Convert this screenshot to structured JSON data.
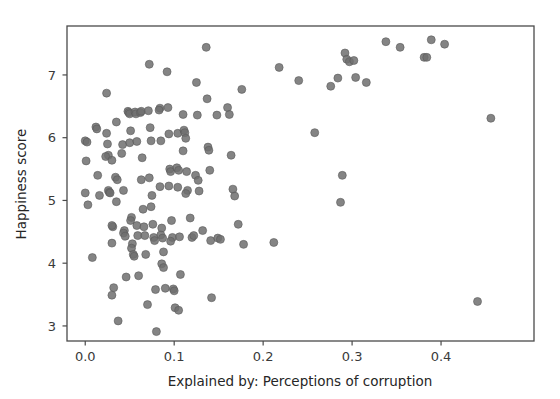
{
  "chart_data": {
    "type": "scatter",
    "title": "",
    "subtitle": "",
    "xlabel": "Explained by: Perceptions of corruption",
    "ylabel": "Happiness score",
    "xlim": [
      -0.0205,
      0.5045
    ],
    "ylim": [
      2.76,
      7.78
    ],
    "xticks": [
      0.0,
      0.1,
      0.2,
      0.3,
      0.4
    ],
    "xtick_labels": [
      "0.0",
      "0.1",
      "0.2",
      "0.3",
      "0.4"
    ],
    "yticks": [
      3,
      4,
      5,
      6,
      7
    ],
    "ytick_labels": [
      "3",
      "4",
      "5",
      "6",
      "7"
    ],
    "grid": false,
    "legend": false,
    "legend_position": "none",
    "marker": {
      "shape": "circle",
      "color": "#6e6e6e",
      "edge_color": "#5a5a5a",
      "size": 8,
      "alpha": 0.85
    },
    "spines": {
      "color": "#4a4a4a",
      "top": true,
      "right": true,
      "bottom": true,
      "left": true
    },
    "n_points": 155,
    "points": [
      [
        0.0,
        5.95
      ],
      [
        0.002,
        5.93
      ],
      [
        0.001,
        5.63
      ],
      [
        0.0,
        5.12
      ],
      [
        0.003,
        4.93
      ],
      [
        0.008,
        4.09
      ],
      [
        0.012,
        6.17
      ],
      [
        0.013,
        6.14
      ],
      [
        0.014,
        5.4
      ],
      [
        0.016,
        5.08
      ],
      [
        0.024,
        6.71
      ],
      [
        0.024,
        6.07
      ],
      [
        0.025,
        5.9
      ],
      [
        0.026,
        5.72
      ],
      [
        0.023,
        5.7
      ],
      [
        0.026,
        5.16
      ],
      [
        0.027,
        5.13
      ],
      [
        0.03,
        5.64
      ],
      [
        0.028,
        5.12
      ],
      [
        0.031,
        4.58
      ],
      [
        0.03,
        4.6
      ],
      [
        0.03,
        4.32
      ],
      [
        0.032,
        3.61
      ],
      [
        0.03,
        3.49
      ],
      [
        0.035,
        6.25
      ],
      [
        0.034,
        5.37
      ],
      [
        0.036,
        5.33
      ],
      [
        0.035,
        4.98
      ],
      [
        0.037,
        3.08
      ],
      [
        0.042,
        5.89
      ],
      [
        0.041,
        5.75
      ],
      [
        0.043,
        5.16
      ],
      [
        0.044,
        4.52
      ],
      [
        0.043,
        4.48
      ],
      [
        0.045,
        4.43
      ],
      [
        0.046,
        3.78
      ],
      [
        0.048,
        6.42
      ],
      [
        0.049,
        6.4
      ],
      [
        0.05,
        6.38
      ],
      [
        0.051,
        6.11
      ],
      [
        0.05,
        5.92
      ],
      [
        0.052,
        4.73
      ],
      [
        0.051,
        4.68
      ],
      [
        0.053,
        4.31
      ],
      [
        0.052,
        4.24
      ],
      [
        0.054,
        4.14
      ],
      [
        0.055,
        4.11
      ],
      [
        0.056,
        6.41
      ],
      [
        0.057,
        6.38
      ],
      [
        0.058,
        5.94
      ],
      [
        0.058,
        4.6
      ],
      [
        0.059,
        4.44
      ],
      [
        0.06,
        3.8
      ],
      [
        0.062,
        6.4
      ],
      [
        0.063,
        6.42
      ],
      [
        0.064,
        5.68
      ],
      [
        0.063,
        5.33
      ],
      [
        0.065,
        4.86
      ],
      [
        0.066,
        4.58
      ],
      [
        0.067,
        4.44
      ],
      [
        0.068,
        4.14
      ],
      [
        0.07,
        3.34
      ],
      [
        0.072,
        7.17
      ],
      [
        0.071,
        6.43
      ],
      [
        0.073,
        6.16
      ],
      [
        0.074,
        5.95
      ],
      [
        0.072,
        5.36
      ],
      [
        0.075,
        5.08
      ],
      [
        0.074,
        4.9
      ],
      [
        0.076,
        4.62
      ],
      [
        0.077,
        4.41
      ],
      [
        0.078,
        4.36
      ],
      [
        0.079,
        3.58
      ],
      [
        0.08,
        2.91
      ],
      [
        0.084,
        6.47
      ],
      [
        0.083,
        6.44
      ],
      [
        0.085,
        5.95
      ],
      [
        0.084,
        5.22
      ],
      [
        0.086,
        4.56
      ],
      [
        0.085,
        4.45
      ],
      [
        0.087,
        4.4
      ],
      [
        0.088,
        4.18
      ],
      [
        0.086,
        3.99
      ],
      [
        0.088,
        3.93
      ],
      [
        0.09,
        3.6
      ],
      [
        0.092,
        7.05
      ],
      [
        0.093,
        6.48
      ],
      [
        0.094,
        6.06
      ],
      [
        0.095,
        5.5
      ],
      [
        0.096,
        5.46
      ],
      [
        0.094,
        5.23
      ],
      [
        0.097,
        4.68
      ],
      [
        0.098,
        4.41
      ],
      [
        0.096,
        4.35
      ],
      [
        0.099,
        3.59
      ],
      [
        0.1,
        3.56
      ],
      [
        0.101,
        3.29
      ],
      [
        0.104,
        6.07
      ],
      [
        0.103,
        5.52
      ],
      [
        0.105,
        5.48
      ],
      [
        0.104,
        5.21
      ],
      [
        0.106,
        4.42
      ],
      [
        0.107,
        3.82
      ],
      [
        0.105,
        3.25
      ],
      [
        0.11,
        6.37
      ],
      [
        0.111,
        6.12
      ],
      [
        0.112,
        6.08
      ],
      [
        0.11,
        5.79
      ],
      [
        0.113,
        5.99
      ],
      [
        0.114,
        5.46
      ],
      [
        0.115,
        5.16
      ],
      [
        0.113,
        5.11
      ],
      [
        0.118,
        4.72
      ],
      [
        0.12,
        4.41
      ],
      [
        0.122,
        4.44
      ],
      [
        0.125,
        6.88
      ],
      [
        0.126,
        6.36
      ],
      [
        0.124,
        5.4
      ],
      [
        0.127,
        5.32
      ],
      [
        0.128,
        5.15
      ],
      [
        0.132,
        4.52
      ],
      [
        0.136,
        7.44
      ],
      [
        0.137,
        6.62
      ],
      [
        0.138,
        5.85
      ],
      [
        0.139,
        5.8
      ],
      [
        0.14,
        5.48
      ],
      [
        0.141,
        4.36
      ],
      [
        0.142,
        3.45
      ],
      [
        0.148,
        6.36
      ],
      [
        0.149,
        4.4
      ],
      [
        0.152,
        4.38
      ],
      [
        0.16,
        6.48
      ],
      [
        0.162,
        6.37
      ],
      [
        0.164,
        5.72
      ],
      [
        0.166,
        5.18
      ],
      [
        0.168,
        5.07
      ],
      [
        0.172,
        4.62
      ],
      [
        0.176,
        6.77
      ],
      [
        0.178,
        4.3
      ],
      [
        0.212,
        4.33
      ],
      [
        0.218,
        7.12
      ],
      [
        0.24,
        6.91
      ],
      [
        0.258,
        6.08
      ],
      [
        0.276,
        6.82
      ],
      [
        0.284,
        6.95
      ],
      [
        0.287,
        4.97
      ],
      [
        0.289,
        5.4
      ],
      [
        0.292,
        7.35
      ],
      [
        0.294,
        7.25
      ],
      [
        0.297,
        7.21
      ],
      [
        0.302,
        7.23
      ],
      [
        0.304,
        6.96
      ],
      [
        0.316,
        6.88
      ],
      [
        0.338,
        7.53
      ],
      [
        0.354,
        7.44
      ],
      [
        0.381,
        7.28
      ],
      [
        0.384,
        7.28
      ],
      [
        0.389,
        7.56
      ],
      [
        0.404,
        7.49
      ],
      [
        0.441,
        3.39
      ],
      [
        0.456,
        6.31
      ]
    ]
  },
  "figure": {
    "width": 560,
    "height": 399,
    "background": "#ffffff",
    "plot_area": {
      "left": 67,
      "top": 26,
      "right": 534,
      "bottom": 341
    }
  }
}
